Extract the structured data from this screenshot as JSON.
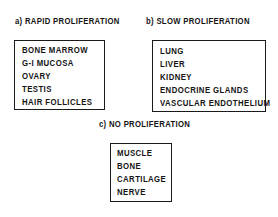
{
  "figure": {
    "background_color": "#ffffff",
    "ink_color": "#141414",
    "border_color": "#1a1a1a"
  },
  "panels": [
    {
      "key": "a",
      "caption": "a) RAPID PROLIFERATION",
      "items": [
        "BONE MARROW",
        "G-I MUCOSA",
        "OVARY",
        "TESTIS",
        "HAIR FOLLICLES"
      ]
    },
    {
      "key": "b",
      "caption": "b) SLOW PROLIFERATION",
      "items": [
        "LUNG",
        "LIVER",
        "KIDNEY",
        "ENDOCRINE GLANDS",
        "VASCULAR ENDOTHELIUM"
      ]
    },
    {
      "key": "c",
      "caption": "c) NO PROLIFERATION",
      "items": [
        "MUSCLE",
        "BONE",
        "CARTILAGE",
        "NERVE"
      ]
    }
  ]
}
